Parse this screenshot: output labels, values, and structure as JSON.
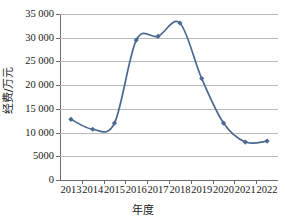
{
  "chart_data": {
    "type": "line",
    "title": "",
    "xlabel": "年度",
    "ylabel": "经费/万元",
    "categories": [
      "2013",
      "2014",
      "2015",
      "2016",
      "2017",
      "2018",
      "2019",
      "2020",
      "2021",
      "2022"
    ],
    "x": [
      2013,
      2014,
      2015,
      2016,
      2017,
      2018,
      2019,
      2020,
      2021,
      2022
    ],
    "values": [
      12800,
      10700,
      12000,
      29500,
      30300,
      33100,
      21400,
      12000,
      8000,
      8200
    ],
    "series": [
      {
        "name": "经费",
        "values": [
          12800,
          10700,
          12000,
          29500,
          30300,
          33100,
          21400,
          12000,
          8000,
          8200
        ]
      }
    ],
    "ylim": [
      0,
      35000
    ],
    "ytick_values": [
      0,
      5000,
      10000,
      15000,
      20000,
      25000,
      30000,
      35000
    ],
    "ytick_labels": [
      "0",
      "5000",
      "10 000",
      "15 000",
      "20 000",
      "25 000",
      "30 000",
      "35 000"
    ],
    "xtick_labels": [
      "2013",
      "2014",
      "2015",
      "2016",
      "2017",
      "2018",
      "2019",
      "2020",
      "2021",
      "2022"
    ],
    "grid": true,
    "grid_axis": "y",
    "legend": false,
    "legend_position": "none",
    "marker": "diamond",
    "line_color": "#4a6890",
    "marker_color": "#4a6890",
    "grid_color": "#b8b8b8",
    "axis_color": "#6d6d6d",
    "background_color": "#ffffff",
    "smoothed": true
  }
}
